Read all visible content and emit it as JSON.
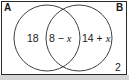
{
  "diagram": {
    "type": "venn",
    "universal_set_outside": "2",
    "sets": [
      {
        "label": "A",
        "only_region": "18"
      },
      {
        "label": "B",
        "only_region": "14 + x"
      }
    ],
    "intersection": "8 − x",
    "regions": {
      "a_only": {
        "num": "18"
      },
      "intersection": {
        "num": "8 − ",
        "var": "x"
      },
      "b_only": {
        "num": "14 + ",
        "var": "x"
      },
      "outside": {
        "num": "2"
      }
    },
    "colors": {
      "stroke": "#2a2a2a",
      "background": "#ffffff",
      "shadow": "#c8c8c8"
    }
  }
}
